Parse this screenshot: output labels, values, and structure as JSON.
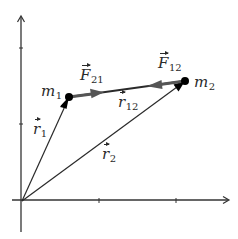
{
  "diagram": {
    "colors": {
      "axis": "#333333",
      "vector_line": "#2a2a2a",
      "force_arrow": "#555555",
      "mass_point": "#000000",
      "label": "#2a2a2a",
      "background": "#ffffff"
    },
    "axes": {
      "origin": [
        23,
        200
      ],
      "x_axis": {
        "from": [
          12,
          200
        ],
        "to": [
          229,
          200
        ],
        "ticks": [
          99,
          176
        ]
      },
      "y_axis": {
        "from": [
          21,
          232
        ],
        "to": [
          21,
          16
        ],
        "ticks": [
          48,
          124
        ]
      }
    },
    "points": {
      "m1": {
        "label": "m",
        "sub": "1",
        "pos": [
          69,
          97
        ]
      },
      "m2": {
        "label": "m",
        "sub": "2",
        "pos": [
          185,
          81
        ]
      }
    },
    "vectors": {
      "r1": {
        "label": "r",
        "sub": "1",
        "from": "origin",
        "to": "m1"
      },
      "r2": {
        "label": "r",
        "sub": "2",
        "from": "origin",
        "to": "m2"
      },
      "r12": {
        "label": "r",
        "sub": "12",
        "from": "m1",
        "to": "m2"
      },
      "F21": {
        "label": "F",
        "sub": "21",
        "from": "m1",
        "direction": "toward m2"
      },
      "F12": {
        "label": "F",
        "sub": "12",
        "from": "m2",
        "direction": "toward m1"
      }
    }
  }
}
